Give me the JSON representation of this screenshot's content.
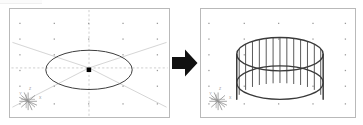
{
  "figure": {
    "type": "cad-extrude-illustration",
    "caption_before": "",
    "caption_after": "",
    "arrow_label": "extrude",
    "background_color": "#ffffff",
    "panel_border_color": "#b9b9b9",
    "construction_line_color": "#c9c9c9",
    "grid_dot_color": "#9a9a9a",
    "geometry_line_color": "#3a3a3a",
    "arrow_color": "#111111",
    "axis_label_color": "#8a8a8a"
  },
  "panel_before": {
    "name": "sketch-plane-with-circle",
    "grid": {
      "dot_columns": 5,
      "dot_rows": 5,
      "dot_size_px": 1
    },
    "center_marker": {
      "shape": "square",
      "color": "#000000",
      "size_px": 4
    },
    "circle": {
      "shape": "ellipse",
      "rx": 44,
      "ry": 20,
      "stroke": "#3a3a3a",
      "stroke_width": 1
    },
    "construction_lines": [
      "diagonal-top-left-to-center",
      "diagonal-top-right-to-center",
      "diagonal-bottom-left-to-center",
      "diagonal-bottom-right-to-center",
      "vertical-center-dashed",
      "horizontal-center-dashed"
    ],
    "axis_indicator": {
      "name": "view-axis-star",
      "labels": [
        "X",
        "Y",
        "Z"
      ],
      "spokes": 8
    }
  },
  "panel_after": {
    "name": "extruded-cylinder",
    "grid": {
      "dot_columns": 5,
      "dot_rows": 5,
      "dot_size_px": 1
    },
    "cylinder": {
      "shape": "cylinder",
      "rx": 44,
      "ry": 17,
      "height_px": 46,
      "ruling_lines": 13,
      "stroke": "#3a3a3a",
      "stroke_width": 1,
      "silhouette_stroke_width": 1.6
    },
    "axis_indicator": {
      "name": "view-axis-star",
      "labels": [
        "X",
        "Y",
        "Z"
      ],
      "spokes": 8
    }
  },
  "arrow": {
    "name": "transform-arrow",
    "direction": "right",
    "color": "#111111"
  }
}
